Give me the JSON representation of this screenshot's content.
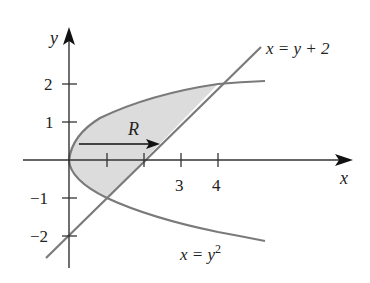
{
  "diagram": {
    "type": "region-between-curves",
    "axes": {
      "x_label": "x",
      "y_label": "y",
      "x_ticks": [
        {
          "value": 1,
          "label": ""
        },
        {
          "value": 2,
          "label": ""
        },
        {
          "value": 3,
          "label": "3"
        },
        {
          "value": 4,
          "label": "4"
        }
      ],
      "y_ticks": [
        {
          "value": 2,
          "label": "2"
        },
        {
          "value": 1,
          "label": "1"
        },
        {
          "value": -1,
          "label": "−1"
        },
        {
          "value": -2,
          "label": "−2"
        }
      ]
    },
    "curves": [
      {
        "name": "line",
        "equation": "x = y + 2",
        "label_prefix": "x = y + 2"
      },
      {
        "name": "parabola",
        "equation": "x = y^2",
        "label_main": "x = y",
        "label_exp": "2"
      }
    ],
    "region": {
      "label": "R",
      "fill": "#dcdcdc"
    },
    "colors": {
      "axis": "#333333",
      "curve": "#7a7a7a",
      "region_fill": "#dcdcdc",
      "text": "#222222"
    }
  }
}
